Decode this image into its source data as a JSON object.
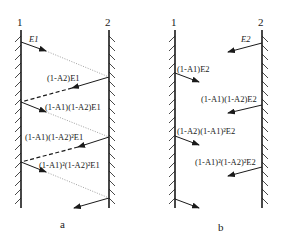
{
  "panel_a": {
    "caption": "a",
    "wall_left_label": "1",
    "wall_right_label": "2",
    "labels": [
      "E1",
      "(1-A2)E1",
      "(1-A1)(1-A2)E1",
      "(1-A1)(1-A2)²E1",
      "(1-A1)²(1-A2)²E1"
    ]
  },
  "panel_b": {
    "caption": "b",
    "wall_left_label": "1",
    "wall_right_label": "2",
    "labels": [
      "E2",
      "(1-A1)E2",
      "(1-A1)(1-A2)E2",
      "(1-A2)(1-A1)²E2",
      "(1-A1)²(1-A2)²E2"
    ]
  },
  "colors": {
    "line": "#1a1a1a",
    "dotted": "#888888"
  }
}
